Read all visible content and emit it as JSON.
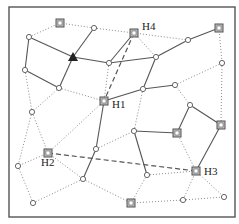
{
  "diagram": {
    "title": "",
    "colors": {
      "edge_solid": "#555555",
      "edge_dotted": "#8a8a8a",
      "node_fill": "#ffffff",
      "hub_fill": "#bdbdbd",
      "triangle_fill": "#222222"
    },
    "nodes": [
      {
        "id": "n0",
        "shape": "square",
        "label": ""
      },
      {
        "id": "n1",
        "shape": "circle",
        "label": ""
      },
      {
        "id": "n2",
        "shape": "square",
        "label": "H4"
      },
      {
        "id": "n3",
        "shape": "square",
        "label": ""
      },
      {
        "id": "n4",
        "shape": "circle",
        "label": ""
      },
      {
        "id": "n5",
        "shape": "circle",
        "label": ""
      },
      {
        "id": "n6",
        "shape": "triangle",
        "label": ""
      },
      {
        "id": "n7",
        "shape": "circle",
        "label": ""
      },
      {
        "id": "n8",
        "shape": "circle",
        "label": ""
      },
      {
        "id": "n9",
        "shape": "circle",
        "label": ""
      },
      {
        "id": "n10",
        "shape": "circle",
        "label": ""
      },
      {
        "id": "n11",
        "shape": "circle",
        "label": ""
      },
      {
        "id": "n12",
        "shape": "circle",
        "label": ""
      },
      {
        "id": "n13",
        "shape": "circle",
        "label": ""
      },
      {
        "id": "n14",
        "shape": "square",
        "label": "H1"
      },
      {
        "id": "n15",
        "shape": "circle",
        "label": ""
      },
      {
        "id": "n16",
        "shape": "circle",
        "label": ""
      },
      {
        "id": "n17",
        "shape": "square",
        "label": ""
      },
      {
        "id": "n18",
        "shape": "circle",
        "label": ""
      },
      {
        "id": "n19",
        "shape": "square",
        "label": ""
      },
      {
        "id": "n20",
        "shape": "circle",
        "label": ""
      },
      {
        "id": "n21",
        "shape": "square",
        "label": "H2"
      },
      {
        "id": "n22",
        "shape": "circle",
        "label": ""
      },
      {
        "id": "n23",
        "shape": "square",
        "label": "H3"
      },
      {
        "id": "n24",
        "shape": "circle",
        "label": ""
      },
      {
        "id": "n25",
        "shape": "circle",
        "label": ""
      },
      {
        "id": "n26",
        "shape": "circle",
        "label": ""
      },
      {
        "id": "n27",
        "shape": "square",
        "label": ""
      },
      {
        "id": "n28",
        "shape": "circle",
        "label": ""
      },
      {
        "id": "n29",
        "shape": "circle",
        "label": ""
      }
    ],
    "edges": [
      {
        "from": "n4",
        "to": "n6",
        "style": "solid"
      },
      {
        "from": "n6",
        "to": "n7",
        "style": "solid"
      },
      {
        "from": "n7",
        "to": "n8",
        "style": "solid"
      },
      {
        "from": "n8",
        "to": "n5",
        "style": "solid"
      },
      {
        "from": "n5",
        "to": "n3",
        "style": "solid"
      },
      {
        "from": "n6",
        "to": "n1",
        "style": "solid"
      },
      {
        "from": "n6",
        "to": "n11",
        "style": "solid"
      },
      {
        "from": "n4",
        "to": "n10",
        "style": "solid"
      },
      {
        "from": "n10",
        "to": "n11",
        "style": "solid"
      },
      {
        "from": "n2",
        "to": "n7",
        "style": "solid"
      },
      {
        "from": "n8",
        "to": "n12",
        "style": "solid"
      },
      {
        "from": "n14",
        "to": "n12",
        "style": "solid"
      },
      {
        "from": "n12",
        "to": "n13",
        "style": "solid"
      },
      {
        "from": "n14",
        "to": "n20",
        "style": "solid"
      },
      {
        "from": "n20",
        "to": "n24",
        "style": "solid"
      },
      {
        "from": "n16",
        "to": "n17",
        "style": "solid"
      },
      {
        "from": "n16",
        "to": "n19",
        "style": "solid"
      },
      {
        "from": "n17",
        "to": "n23",
        "style": "solid"
      },
      {
        "from": "n18",
        "to": "n19",
        "style": "solid"
      },
      {
        "from": "n18",
        "to": "n25",
        "style": "solid"
      },
      {
        "from": "n2",
        "to": "n14",
        "style": "dashed"
      },
      {
        "from": "n21",
        "to": "n23",
        "style": "dashed"
      },
      {
        "from": "n4",
        "to": "n0",
        "style": "dotted"
      },
      {
        "from": "n0",
        "to": "n1",
        "style": "dotted"
      },
      {
        "from": "n1",
        "to": "n2",
        "style": "dotted"
      },
      {
        "from": "n2",
        "to": "n5",
        "style": "dotted"
      },
      {
        "from": "n2",
        "to": "n8",
        "style": "dotted"
      },
      {
        "from": "n3",
        "to": "n9",
        "style": "dotted"
      },
      {
        "from": "n9",
        "to": "n17",
        "style": "dotted"
      },
      {
        "from": "n9",
        "to": "n13",
        "style": "dotted"
      },
      {
        "from": "n13",
        "to": "n16",
        "style": "dotted"
      },
      {
        "from": "n7",
        "to": "n14",
        "style": "dotted"
      },
      {
        "from": "n11",
        "to": "n14",
        "style": "dotted"
      },
      {
        "from": "n10",
        "to": "n15",
        "style": "dotted"
      },
      {
        "from": "n11",
        "to": "n15",
        "style": "dotted"
      },
      {
        "from": "n15",
        "to": "n21",
        "style": "dotted"
      },
      {
        "from": "n15",
        "to": "n22",
        "style": "dotted"
      },
      {
        "from": "n14",
        "to": "n21",
        "style": "dotted"
      },
      {
        "from": "n21",
        "to": "n22",
        "style": "dotted"
      },
      {
        "from": "n21",
        "to": "n24",
        "style": "dotted"
      },
      {
        "from": "n22",
        "to": "n26",
        "style": "dotted"
      },
      {
        "from": "n26",
        "to": "n24",
        "style": "dotted"
      },
      {
        "from": "n12",
        "to": "n18",
        "style": "dotted"
      },
      {
        "from": "n20",
        "to": "n18",
        "style": "dotted"
      },
      {
        "from": "n24",
        "to": "n27",
        "style": "dotted"
      },
      {
        "from": "n25",
        "to": "n27",
        "style": "dotted"
      },
      {
        "from": "n25",
        "to": "n23",
        "style": "dotted"
      },
      {
        "from": "n19",
        "to": "n23",
        "style": "dotted"
      },
      {
        "from": "n23",
        "to": "n28",
        "style": "dotted"
      },
      {
        "from": "n23",
        "to": "n29",
        "style": "dotted"
      },
      {
        "from": "n27",
        "to": "n28",
        "style": "dotted"
      },
      {
        "from": "n28",
        "to": "n29",
        "style": "dotted"
      }
    ]
  }
}
